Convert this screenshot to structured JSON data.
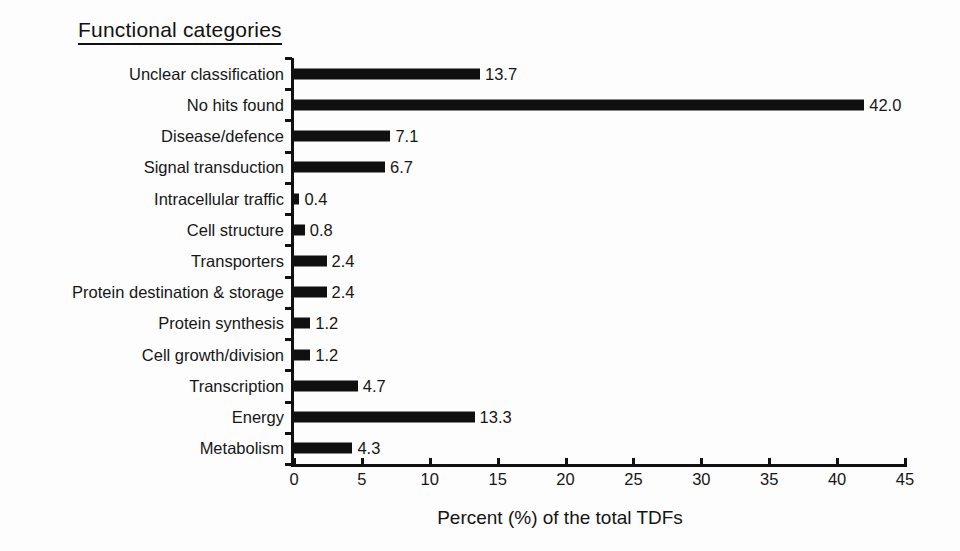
{
  "chart_data": {
    "type": "bar",
    "orientation": "horizontal",
    "title": "Functional categories",
    "xlabel": "Percent (%) of the total TDFs",
    "ylabel": "",
    "xlim": [
      0,
      45
    ],
    "xticks": [
      0,
      5,
      10,
      15,
      20,
      25,
      30,
      35,
      40,
      45
    ],
    "grid": false,
    "legend": null,
    "bar_color": "#101010",
    "background_color": "#fdfdfd",
    "categories": [
      "Unclear classification",
      "No hits found",
      "Disease/defence",
      "Signal transduction",
      "Intracellular traffic",
      "Cell structure",
      "Transporters",
      "Protein destination & storage",
      "Protein synthesis",
      "Cell growth/division",
      "Transcription",
      "Energy",
      "Metabolism"
    ],
    "values": [
      13.7,
      42.0,
      7.1,
      6.7,
      0.4,
      0.8,
      2.4,
      2.4,
      1.2,
      1.2,
      4.7,
      13.3,
      4.3
    ],
    "value_labels": [
      "13.7",
      "42.0",
      "7.1",
      "6.7",
      "0.4",
      "0.8",
      "2.4",
      "2.4",
      "1.2",
      "1.2",
      "4.7",
      "13.3",
      "4.3"
    ]
  }
}
